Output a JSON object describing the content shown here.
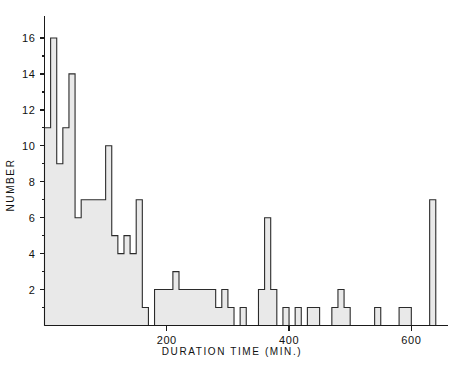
{
  "chart_data": {
    "type": "bar",
    "title": "",
    "xlabel": "DURATION TIME (MIN.)",
    "ylabel": "NUMBER",
    "xlim": [
      0,
      660
    ],
    "ylim": [
      0,
      17
    ],
    "bin_width": 10,
    "grid": false,
    "legend": null,
    "xticks": [
      200,
      400,
      600
    ],
    "xtick_labels": [
      "200",
      "400",
      "600"
    ],
    "yticks": [
      2,
      4,
      6,
      8,
      10,
      12,
      14,
      16
    ],
    "ytick_labels": [
      "2",
      "4",
      "6",
      "8",
      "10",
      "12",
      "14",
      "16"
    ],
    "yticks_minor": [
      1,
      3,
      5,
      7,
      9,
      11,
      13,
      15
    ],
    "bar_color": "#e9e9e9",
    "edge_color": "#2b2b2b",
    "axis_color": "#1a1a1a",
    "categories": [
      "0-10",
      "10-20",
      "20-30",
      "30-40",
      "40-50",
      "50-60",
      "60-70",
      "70-80",
      "80-90",
      "90-100",
      "100-110",
      "110-120",
      "120-130",
      "130-140",
      "140-150",
      "150-160",
      "160-170",
      "170-180",
      "180-190",
      "190-200",
      "200-210",
      "210-220",
      "220-230",
      "230-240",
      "240-250",
      "250-260",
      "260-270",
      "270-280",
      "280-290",
      "290-300",
      "300-310",
      "310-320",
      "320-330",
      "330-340",
      "340-350",
      "350-360",
      "360-370",
      "370-380",
      "380-390",
      "390-400",
      "400-410",
      "410-420",
      "420-430",
      "430-440",
      "440-450",
      "450-460",
      "460-470",
      "470-480",
      "480-490",
      "490-500",
      "500-510",
      "510-520",
      "520-530",
      "530-540",
      "540-550",
      "550-560",
      "560-570",
      "570-580",
      "580-590",
      "590-600",
      "600-610",
      "610-620",
      "620-630",
      "630-640",
      "640-650",
      "650-660"
    ],
    "bin_starts": [
      0,
      10,
      20,
      30,
      40,
      50,
      60,
      70,
      80,
      90,
      100,
      110,
      120,
      130,
      140,
      150,
      160,
      170,
      180,
      190,
      200,
      210,
      220,
      230,
      240,
      250,
      260,
      270,
      280,
      290,
      300,
      310,
      320,
      330,
      340,
      350,
      360,
      370,
      380,
      390,
      400,
      410,
      420,
      430,
      440,
      450,
      460,
      470,
      480,
      490,
      500,
      510,
      520,
      530,
      540,
      550,
      560,
      570,
      580,
      590,
      600,
      610,
      620,
      630,
      640,
      650
    ],
    "values": [
      11,
      16,
      9,
      11,
      14,
      6,
      7,
      7,
      7,
      7,
      10,
      5,
      4,
      5,
      4,
      7,
      1,
      0,
      2,
      2,
      2,
      3,
      2,
      2,
      2,
      2,
      2,
      2,
      1,
      2,
      1,
      0,
      1,
      0,
      0,
      2,
      6,
      2,
      0,
      1,
      0,
      1,
      0,
      1,
      1,
      0,
      0,
      1,
      2,
      1,
      0,
      0,
      0,
      0,
      1,
      0,
      0,
      0,
      1,
      1,
      0,
      0,
      0,
      7,
      0,
      0
    ]
  },
  "axes": {
    "y_label": "NUMBER",
    "x_label": "DURATION TIME (MIN.)"
  }
}
